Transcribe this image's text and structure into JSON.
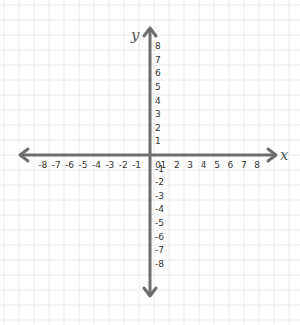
{
  "chart_data": {
    "type": "coordinate_plane",
    "title": "",
    "xlabel": "x",
    "ylabel": "y",
    "xlim": [
      -8,
      8
    ],
    "ylim": [
      -8,
      8
    ],
    "x_ticks": [
      "-8",
      "-7",
      "-6",
      "-5",
      "-4",
      "-3",
      "-2",
      "-1",
      "0",
      "1",
      "2",
      "3",
      "4",
      "5",
      "6",
      "7",
      "8"
    ],
    "y_ticks": [
      "8",
      "7",
      "6",
      "5",
      "4",
      "3",
      "2",
      "1",
      "-1",
      "-2",
      "-3",
      "-4",
      "-5",
      "-6",
      "-7",
      "-8"
    ],
    "grid": true,
    "series": [],
    "arrows": {
      "x_axis": "both_ends",
      "y_axis": "both_ends"
    }
  },
  "colors": {
    "axis": "#6e6e6e",
    "grid": "#ececec",
    "background": "#ffffff",
    "text": "#333333"
  },
  "labels": {
    "x_axis": "x",
    "y_axis": "y"
  }
}
